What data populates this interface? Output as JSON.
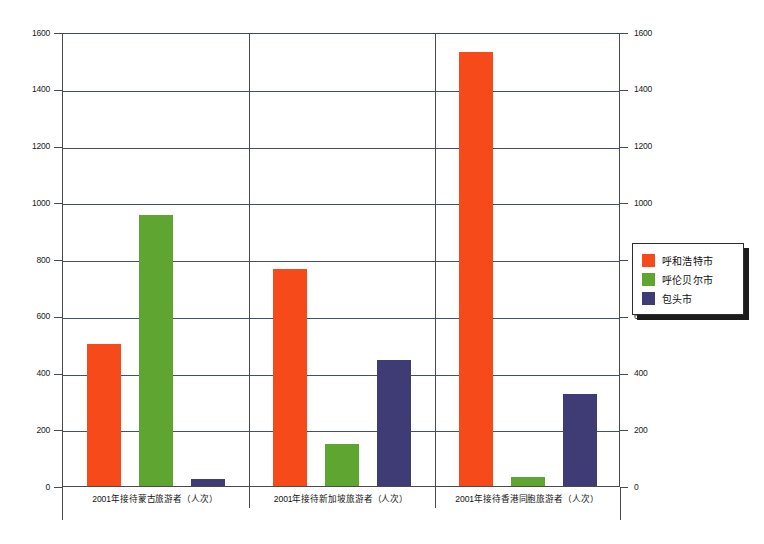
{
  "chart_data": {
    "type": "bar",
    "title": "",
    "subtitle": "",
    "xlabel": "",
    "ylabel": "",
    "ylim": [
      0,
      1600
    ],
    "ytick_step": 200,
    "yticks": [
      "0",
      "200",
      "400",
      "600",
      "800",
      "1000",
      "1200",
      "1400",
      "1600"
    ],
    "grid": true,
    "dual_axis": true,
    "right_axis_ticks": [
      "0",
      "200",
      "400",
      "600",
      "800",
      "1000",
      "1200",
      "1400",
      "1600"
    ],
    "legend_position": "right",
    "categories": [
      "2001年接待蒙古旅游者（人次）",
      "2001年接待新加坡旅游者（人次）",
      "2001年接待香港同胞旅游者（人次）"
    ],
    "series": [
      {
        "name": "呼和浩特市",
        "color": "#f74a1b",
        "values": [
          500,
          765,
          1530
        ]
      },
      {
        "name": "呼伦贝尔市",
        "color": "#5fa531",
        "values": [
          955,
          148,
          33
        ]
      },
      {
        "name": "包头市",
        "color": "#3f3b75",
        "values": [
          25,
          443,
          325
        ]
      }
    ]
  },
  "legend": {
    "items": [
      {
        "label": "呼和浩特市",
        "color": "#f74a1b"
      },
      {
        "label": "呼伦贝尔市",
        "color": "#5fa531"
      },
      {
        "label": "包头市",
        "color": "#3f3b75"
      }
    ]
  }
}
